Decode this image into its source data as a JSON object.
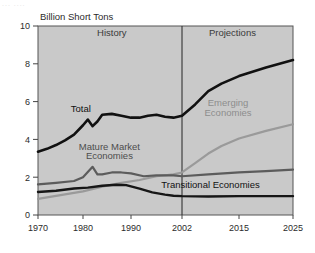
{
  "figure": {
    "ghost_top_text": "... ....",
    "plot_bg_color": "#c9c9c9",
    "plot_border_color": "#555555",
    "divider_color": "#333333"
  },
  "chart_data": {
    "type": "line",
    "title": "",
    "ylabel": "Billion Short Tons",
    "xlabel": "",
    "ylim": [
      0,
      10
    ],
    "xlim": [
      1970,
      2025
    ],
    "yticks": [
      0,
      2,
      4,
      6,
      8,
      10
    ],
    "ytick_labels": [
      "0",
      "2",
      "4",
      "6",
      "8",
      "10"
    ],
    "xticks": [
      1970,
      1980,
      1990,
      2002,
      2015,
      2025
    ],
    "xtick_labels": [
      "1970",
      "1980",
      "1990",
      "2002",
      "2015",
      "2025"
    ],
    "grid": false,
    "legend_position": "inline-annotations",
    "annotations": [
      {
        "text": "History",
        "x": 1986,
        "y": 9.45,
        "style": "panel"
      },
      {
        "text": "Projections",
        "x": 2013.5,
        "y": 9.45,
        "style": "panel"
      },
      {
        "text": "Total",
        "x": 1979.5,
        "y": 5.45,
        "style": "dark"
      },
      {
        "text": "Mature Market",
        "x": 1985.5,
        "y": 3.45,
        "style": "mid"
      },
      {
        "text": "Economies",
        "x": 1985.5,
        "y": 2.95,
        "style": "mid"
      },
      {
        "text": "Emerging",
        "x": 2012.5,
        "y": 5.75,
        "style": "light"
      },
      {
        "text": "Economies",
        "x": 2012.5,
        "y": 5.25,
        "style": "light"
      },
      {
        "text": "Transitional Economies",
        "x": 2008.5,
        "y": 1.45,
        "style": "dark"
      }
    ],
    "divider": {
      "x": 2002,
      "label_left": "History",
      "label_right": "Projections"
    },
    "series": [
      {
        "name": "Total",
        "color": "#111111",
        "width": 2.6,
        "x": [
          1970,
          1972,
          1974,
          1976,
          1978,
          1980,
          1981,
          1982,
          1983,
          1984,
          1986,
          1988,
          1990,
          1992,
          1994,
          1996,
          1998,
          2000,
          2002,
          2005,
          2008,
          2011,
          2015,
          2020,
          2025
        ],
        "values": [
          3.35,
          3.5,
          3.7,
          3.95,
          4.25,
          4.75,
          5.05,
          4.7,
          4.95,
          5.3,
          5.35,
          5.25,
          5.15,
          5.15,
          5.25,
          5.3,
          5.2,
          5.15,
          5.25,
          5.85,
          6.55,
          6.95,
          7.35,
          7.8,
          8.2
        ]
      },
      {
        "name": "Emerging Economies",
        "color": "#9a9a9a",
        "width": 2.2,
        "x": [
          1970,
          1975,
          1980,
          1984,
          1988,
          1992,
          1996,
          2000,
          2002,
          2005,
          2008,
          2011,
          2015,
          2020,
          2025
        ],
        "values": [
          0.85,
          1.05,
          1.25,
          1.5,
          1.7,
          1.85,
          2.05,
          2.15,
          2.25,
          2.75,
          3.25,
          3.65,
          4.05,
          4.45,
          4.8
        ]
      },
      {
        "name": "Mature Market Economies",
        "color": "#5c5c5c",
        "width": 2.2,
        "x": [
          1970,
          1974,
          1978,
          1980,
          1982,
          1983,
          1984,
          1986,
          1988,
          1990,
          1993,
          1996,
          2000,
          2002,
          2008,
          2015,
          2020,
          2025
        ],
        "values": [
          1.62,
          1.7,
          1.8,
          2.0,
          2.55,
          2.15,
          2.15,
          2.25,
          2.25,
          2.2,
          2.05,
          2.1,
          2.1,
          2.05,
          2.15,
          2.25,
          2.32,
          2.4
        ]
      },
      {
        "name": "Transitional Economies",
        "color": "#161616",
        "width": 2.4,
        "x": [
          1970,
          1974,
          1978,
          1981,
          1984,
          1987,
          1989,
          1992,
          1995,
          1998,
          2000,
          2002,
          2008,
          2015,
          2020,
          2025
        ],
        "values": [
          1.22,
          1.28,
          1.4,
          1.45,
          1.55,
          1.6,
          1.58,
          1.4,
          1.2,
          1.08,
          1.02,
          1.0,
          0.98,
          1.0,
          1.0,
          1.0
        ]
      }
    ]
  }
}
